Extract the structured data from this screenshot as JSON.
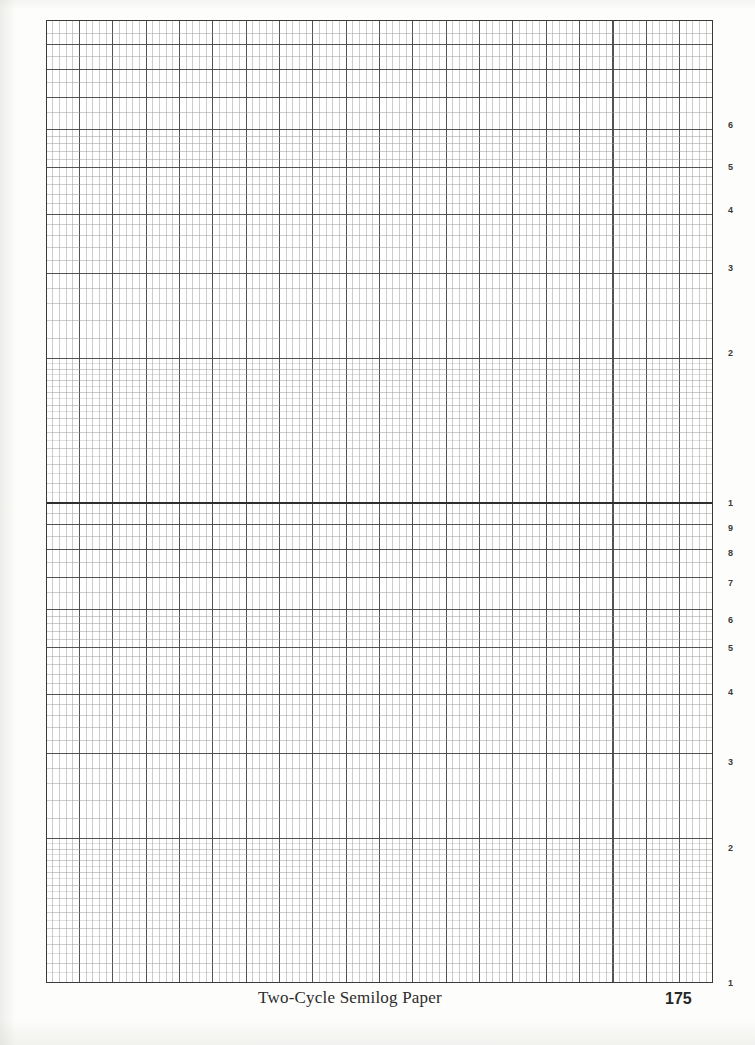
{
  "page": {
    "caption": "Two-Cycle Semilog Paper",
    "page_number": "175",
    "background_color": "#fdfdfb",
    "grid_background_color": "#ffffff"
  },
  "grid": {
    "left": 46,
    "top": 20,
    "width": 667,
    "height": 963,
    "border_color": "#3a3a3a",
    "minor_line_color": "#9a9a9a",
    "major_line_color": "#4a4a4a",
    "decade_line_color": "#2e2e2e",
    "vertical_minor_spacing": 6.67,
    "vertical_major_every": 5,
    "vertical_minor_count": 100
  },
  "axis": {
    "type": "logarithmic",
    "cycles": 2,
    "orientation": "vertical",
    "label_side": "right",
    "top_value_exponent_fraction": 0.78,
    "labels": [
      {
        "text": "6",
        "y": 125
      },
      {
        "text": "5",
        "y": 167
      },
      {
        "text": "4",
        "y": 210
      },
      {
        "text": "3",
        "y": 268
      },
      {
        "text": "2",
        "y": 353
      },
      {
        "text": "1",
        "y": 503
      },
      {
        "text": "9",
        "y": 528
      },
      {
        "text": "8",
        "y": 553
      },
      {
        "text": "7",
        "y": 583
      },
      {
        "text": "6",
        "y": 620
      },
      {
        "text": "5",
        "y": 648
      },
      {
        "text": "4",
        "y": 692
      },
      {
        "text": "3",
        "y": 762
      },
      {
        "text": "2",
        "y": 848
      },
      {
        "text": "1",
        "y": 983
      }
    ]
  },
  "chart_data": {
    "type": "table",
    "title": "Two-Cycle Semilog Paper",
    "xlabel": "",
    "ylabel": "",
    "grid": true,
    "x_axis": {
      "scale": "linear",
      "major_divisions": 20,
      "minor_divisions_per_major": 5,
      "tick_labels": []
    },
    "y_axis": {
      "scale": "log10",
      "decades": 2,
      "tick_labels": [
        "6",
        "5",
        "4",
        "3",
        "2",
        "1",
        "9",
        "8",
        "7",
        "6",
        "5",
        "4",
        "3",
        "2",
        "1"
      ],
      "decade_boundaries": [
        "1",
        "1"
      ]
    },
    "series": []
  }
}
